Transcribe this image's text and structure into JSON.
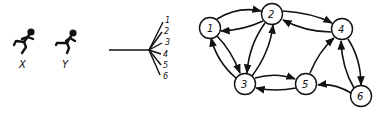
{
  "figures": [
    {
      "label": "X"
    },
    {
      "label": "Y"
    }
  ],
  "fan": {
    "branches": [
      "1",
      "2",
      "3",
      "4",
      "5",
      "6"
    ]
  },
  "graph": {
    "nodes": [
      {
        "id": "1",
        "label": "1"
      },
      {
        "id": "2",
        "label": "2"
      },
      {
        "id": "3",
        "label": "3"
      },
      {
        "id": "4",
        "label": "4"
      },
      {
        "id": "5",
        "label": "5"
      },
      {
        "id": "6",
        "label": "6"
      }
    ],
    "edges": [
      {
        "from": "1",
        "to": "2"
      },
      {
        "from": "2",
        "to": "1"
      },
      {
        "from": "1",
        "to": "3"
      },
      {
        "from": "3",
        "to": "1"
      },
      {
        "from": "2",
        "to": "3"
      },
      {
        "from": "3",
        "to": "2"
      },
      {
        "from": "2",
        "to": "4"
      },
      {
        "from": "4",
        "to": "2"
      },
      {
        "from": "3",
        "to": "5"
      },
      {
        "from": "5",
        "to": "3"
      },
      {
        "from": "5",
        "to": "4"
      },
      {
        "from": "4",
        "to": "6"
      },
      {
        "from": "6",
        "to": "4"
      },
      {
        "from": "6",
        "to": "5"
      }
    ]
  }
}
